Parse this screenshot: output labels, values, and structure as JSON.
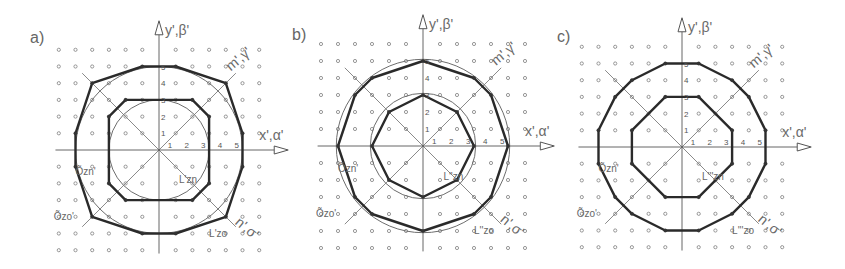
{
  "figure": {
    "panels": [
      {
        "id": "a",
        "label": "a)",
        "center": [
          159,
          150
        ],
        "unit": 16.7,
        "y_axis_label": "y',β'",
        "x_axis_label": "x',α'",
        "diag_m_label": "m',γ'",
        "diag_n_label": "n',σ'",
        "ticks": [
          "1",
          "2",
          "3",
          "4",
          "5"
        ],
        "annotations": {
          "inner_circle": "Õzn'",
          "outer_circle": "Õzo'",
          "inner_polygon": "L'zn",
          "outer_polygon": "L'zo"
        },
        "outer_polygon": [
          [
            -1,
            5
          ],
          [
            1,
            5
          ],
          [
            4,
            4
          ],
          [
            5,
            1
          ],
          [
            5,
            -1
          ],
          [
            4,
            -4
          ],
          [
            1,
            -5
          ],
          [
            -1,
            -5
          ],
          [
            -4,
            -4
          ],
          [
            -5,
            -1
          ],
          [
            -5,
            1
          ],
          [
            -4,
            4
          ]
        ],
        "inner_polygon": [
          [
            -2,
            3
          ],
          [
            2,
            3
          ],
          [
            3,
            2
          ],
          [
            3,
            -2
          ],
          [
            2,
            -3
          ],
          [
            -2,
            -3
          ],
          [
            -3,
            -2
          ],
          [
            -3,
            2
          ]
        ],
        "circle_radii": [
          3,
          5
        ]
      },
      {
        "id": "b",
        "label": "b)",
        "center": [
          423,
          146
        ],
        "unit": 17.0,
        "y_axis_label": "y',β'",
        "x_axis_label": "x',α'",
        "diag_m_label": "m',γ'",
        "diag_n_label": "n',σ'",
        "ticks": [
          "1",
          "2",
          "3",
          "4",
          "5"
        ],
        "annotations": {
          "inner_circle": "Õzn'",
          "outer_circle": "Õzo'",
          "inner_polygon": "L''zn",
          "outer_polygon": "L''zo"
        },
        "outer_polygon": [
          [
            0,
            5
          ],
          [
            3,
            4
          ],
          [
            4,
            3
          ],
          [
            5,
            0
          ],
          [
            4,
            -3
          ],
          [
            3,
            -4
          ],
          [
            0,
            -5
          ],
          [
            -3,
            -4
          ],
          [
            -4,
            -3
          ],
          [
            -5,
            0
          ],
          [
            -4,
            3
          ],
          [
            -3,
            4
          ]
        ],
        "inner_polygon": [
          [
            0,
            3
          ],
          [
            2,
            2
          ],
          [
            3,
            0
          ],
          [
            2,
            -2
          ],
          [
            0,
            -3
          ],
          [
            -2,
            -2
          ],
          [
            -3,
            0
          ],
          [
            -2,
            2
          ]
        ],
        "circle_radii": [
          3.1,
          5.1
        ]
      },
      {
        "id": "c",
        "label": "c)",
        "center": [
          682,
          147
        ],
        "unit": 16.7,
        "y_axis_label": "y',β'",
        "x_axis_label": "x',α'",
        "diag_m_label": "m',γ'",
        "diag_n_label": "n',σ'",
        "ticks": [
          "1",
          "2",
          "3",
          "4",
          "5"
        ],
        "annotations": {
          "inner_circle": "Õzn'",
          "outer_circle": "Õzo'",
          "inner_polygon": "L'''zn",
          "outer_polygon": "L'''zo"
        },
        "outer_polygon": [
          [
            -1,
            5
          ],
          [
            1,
            5
          ],
          [
            3,
            4
          ],
          [
            4,
            3
          ],
          [
            5,
            1
          ],
          [
            5,
            -1
          ],
          [
            4,
            -3
          ],
          [
            3,
            -4
          ],
          [
            1,
            -5
          ],
          [
            -1,
            -5
          ],
          [
            -3,
            -4
          ],
          [
            -4,
            -3
          ],
          [
            -5,
            -1
          ],
          [
            -5,
            1
          ],
          [
            -4,
            3
          ],
          [
            -3,
            4
          ]
        ],
        "inner_polygon": [
          [
            -1,
            3
          ],
          [
            1,
            3
          ],
          [
            3,
            1
          ],
          [
            3,
            -1
          ],
          [
            1,
            -3
          ],
          [
            -1,
            -3
          ],
          [
            -3,
            -1
          ],
          [
            -3,
            1
          ]
        ],
        "circle_radii": []
      }
    ],
    "colors": {
      "polygon": "#2a2a2a",
      "grid_dot": "#8c8c8c",
      "axis": "#555555",
      "text": "#666666"
    }
  }
}
